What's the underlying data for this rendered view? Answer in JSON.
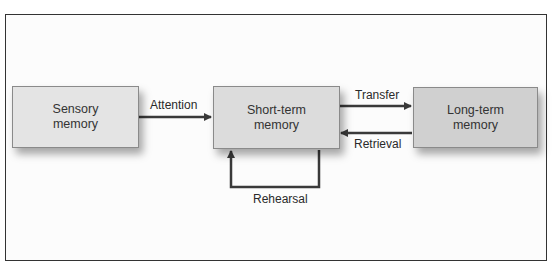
{
  "diagram": {
    "title": "",
    "nodes": [
      {
        "id": "sensory",
        "line1": "Sensory",
        "line2": "memory",
        "fill": "#e4e4e4"
      },
      {
        "id": "short_term",
        "line1": "Short-term",
        "line2": "memory",
        "fill": "#dcdcdc"
      },
      {
        "id": "long_term",
        "line1": "Long-term",
        "line2": "memory",
        "fill": "#d0d0d0"
      }
    ],
    "edges": [
      {
        "from": "sensory",
        "to": "short_term",
        "label": "Attention"
      },
      {
        "from": "short_term",
        "to": "long_term",
        "label": "Transfer"
      },
      {
        "from": "long_term",
        "to": "short_term",
        "label": "Retrieval"
      },
      {
        "from": "short_term",
        "to": "short_term",
        "label": "Rehearsal"
      }
    ],
    "colors": {
      "arrow": "#3a3a3a",
      "border": "#333333"
    }
  }
}
